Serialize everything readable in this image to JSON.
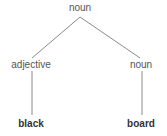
{
  "diagram": {
    "type": "parse-tree",
    "nodes": [
      {
        "id": "root",
        "label": "noun",
        "x": 80,
        "y": 8,
        "bold": false
      },
      {
        "id": "adj",
        "label": "adjective",
        "x": 31,
        "y": 65,
        "bold": false
      },
      {
        "id": "noun2",
        "label": "noun",
        "x": 141,
        "y": 65,
        "bold": false
      },
      {
        "id": "leaf1",
        "label": "black",
        "x": 31,
        "y": 124,
        "bold": true
      },
      {
        "id": "leaf2",
        "label": "board",
        "x": 141,
        "y": 124,
        "bold": true
      }
    ],
    "edges": [
      {
        "from": "root",
        "to": "adj"
      },
      {
        "from": "root",
        "to": "noun2"
      },
      {
        "from": "adj",
        "to": "leaf1"
      },
      {
        "from": "noun2",
        "to": "leaf2"
      }
    ],
    "line_color": "#888888"
  }
}
